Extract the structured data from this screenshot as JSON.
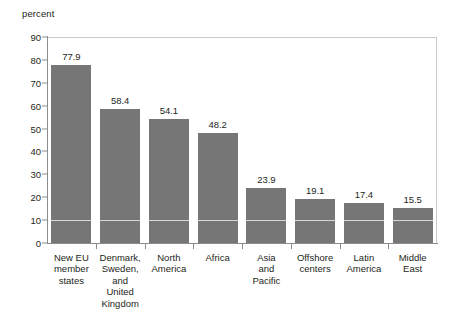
{
  "chart_data": {
    "type": "bar",
    "title": "",
    "subtitle": "",
    "xlabel": "",
    "ylabel": "percent",
    "ylim": [
      0,
      90
    ],
    "ytick_step": 10,
    "yticks": [
      0,
      10,
      20,
      30,
      40,
      50,
      60,
      70,
      80,
      90
    ],
    "ytick_labels": [
      "0",
      "10",
      "20",
      "30",
      "40",
      "50",
      "60",
      "70",
      "80",
      "90"
    ],
    "grid": false,
    "legend": null,
    "legend_position": "none",
    "categories": [
      "New EU\nmember\nstates",
      "Denmark,\nSweden,\nand\nUnited\nKingdom",
      "North\nAmerica",
      "Africa",
      "Asia\nand\nPacific",
      "Offshore\ncenters",
      "Latin\nAmerica",
      "Middle\nEast"
    ],
    "values": [
      77.9,
      58.4,
      54.1,
      48.2,
      23.9,
      19.1,
      17.4,
      15.5
    ],
    "value_labels": [
      "77.9",
      "58.4",
      "54.1",
      "48.2",
      "23.9",
      "19.1",
      "17.4",
      "15.5"
    ],
    "bar_color": "#767676",
    "axis_color": "#8c8c8c",
    "frame_color": "#c9c9c9",
    "text_color": "#231f20",
    "background": "#ffffff",
    "inner_gridline_value": 10,
    "inner_gridline_color": "#e8e8e8"
  },
  "axis": {
    "unit_label": "percent"
  }
}
